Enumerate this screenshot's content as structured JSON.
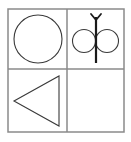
{
  "canvas": {
    "width": 131,
    "height": 142,
    "background": "#ffffff"
  },
  "figure": {
    "type": "matrix-puzzle",
    "rows": 2,
    "columns": 2,
    "frame": {
      "x": 8,
      "y": 9,
      "width": 116,
      "height": 123,
      "stroke": "#8a8a8a",
      "stroke_width": 1.5,
      "fill": "#ffffff"
    },
    "dividers": {
      "vertical_x": 67,
      "horizontal_y": 69,
      "stroke": "#8a8a8a",
      "stroke_width": 1.5
    },
    "stroke_shape": "#3a3a3a",
    "stroke_stem": "#1a1a1a"
  },
  "cells": [
    {
      "id": "cell-top-left",
      "position": "top-left",
      "row": 1,
      "column": 1,
      "content": "circle",
      "label": "Large circle",
      "empty": false,
      "shape": {
        "kind": "circle",
        "cx": 38,
        "cy": 39,
        "r": 24,
        "stroke": "#3a3a3a",
        "stroke_width": 1.1,
        "fill": "none"
      }
    },
    {
      "id": "cell-top-right",
      "position": "top-right",
      "row": 1,
      "column": 2,
      "content": "butterfly",
      "label": "Butterfly figure: two circles on a forked stem",
      "empty": false,
      "shape": {
        "kind": "butterfly",
        "left_circle": {
          "cx": 84,
          "cy": 41,
          "r": 11.5
        },
        "right_circle": {
          "cx": 107,
          "cy": 41,
          "r": 11.5
        },
        "stem": {
          "x": 96,
          "y_top": 17,
          "y_bottom": 63,
          "stroke_width": 2.2
        },
        "fork": {
          "tip_left_x": 91,
          "tip_right_x": 101,
          "tip_y": 14,
          "join_y": 20
        },
        "stroke": "#3a3a3a",
        "stroke_width": 1.1,
        "stem_stroke": "#1a1a1a",
        "fill": "none"
      }
    },
    {
      "id": "cell-bottom-left",
      "position": "bottom-left",
      "row": 2,
      "column": 1,
      "content": "triangle",
      "label": "Left-pointing triangle",
      "empty": false,
      "shape": {
        "kind": "triangle",
        "points": "14,101 59,76 59,126",
        "direction": "left",
        "stroke": "#3a3a3a",
        "stroke_width": 1.1,
        "fill": "none"
      }
    },
    {
      "id": "cell-bottom-right",
      "position": "bottom-right",
      "row": 2,
      "column": 2,
      "content": "blank",
      "label": "Empty answer cell",
      "empty": true,
      "shape": null
    }
  ]
}
